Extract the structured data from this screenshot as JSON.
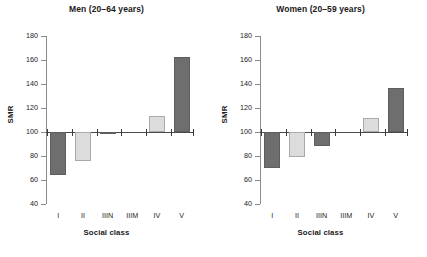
{
  "chart_data": [
    {
      "type": "bar",
      "title": "Men (20–64 years)",
      "xlabel": "Social class",
      "ylabel": "SMR",
      "categories": [
        "I",
        "II",
        "IIIN",
        "IIIM",
        "IV",
        "V"
      ],
      "values": [
        64,
        76,
        98,
        99.5,
        113.5,
        162.5
      ],
      "bar_colors": [
        "#6e6e6e",
        "#dcdcdc",
        "#6e6e6e",
        "#dcdcdc",
        "#dcdcdc",
        "#6e6e6e"
      ],
      "ylim": [
        40,
        180
      ],
      "yticks": [
        40,
        60,
        80,
        100,
        120,
        140,
        160,
        180
      ],
      "ytick_labels": [
        "40",
        "60",
        "80",
        "100",
        "120",
        "140",
        "160",
        "180"
      ],
      "baseline": 100,
      "grid": false,
      "legend": "none"
    },
    {
      "type": "bar",
      "title": "Women (20–59 years)",
      "xlabel": "Social class",
      "ylabel": "SMR",
      "categories": [
        "I",
        "II",
        "IIIN",
        "IIIM",
        "IV",
        "V"
      ],
      "values": [
        70,
        79,
        88,
        100,
        112,
        137
      ],
      "bar_colors": [
        "#6e6e6e",
        "#dcdcdc",
        "#6e6e6e",
        "#dcdcdc",
        "#dcdcdc",
        "#6e6e6e"
      ],
      "ylim": [
        40,
        180
      ],
      "yticks": [
        40,
        60,
        80,
        100,
        120,
        140,
        160,
        180
      ],
      "ytick_labels": [
        "40",
        "60",
        "80",
        "100",
        "120",
        "140",
        "160",
        "180"
      ],
      "baseline": 100,
      "grid": false,
      "legend": "none"
    }
  ],
  "panels": [
    {
      "id": "men",
      "title": "Men (20–64 years)",
      "ylabel": "SMR",
      "xlabel": "Social class"
    },
    {
      "id": "women",
      "title": "Women (20–59 years)",
      "ylabel": "SMR",
      "xlabel": "Social class"
    }
  ],
  "colors": {
    "bar_dark": "#6e6e6e",
    "bar_light": "#dcdcdc",
    "axis": "#8a8a8a",
    "baseline": "#4a4a4a",
    "text": "#1a1a1a",
    "background": "#ffffff"
  }
}
